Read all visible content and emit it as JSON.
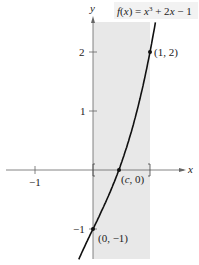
{
  "figure": {
    "function_label": {
      "f": "f",
      "x_open": "(",
      "x": "x",
      "x_close": ")",
      "eq": " = ",
      "xvar": "x",
      "exp": "3",
      "rest": " + 2",
      "xvar2": "x",
      "tail": " − 1"
    },
    "axes": {
      "x_label": "x",
      "y_label": "y",
      "x_ticks": [
        {
          "value": -1,
          "label": "−1"
        },
        {
          "value": 1,
          "label": ""
        }
      ],
      "y_ticks": [
        {
          "value": 2,
          "label": "2"
        },
        {
          "value": 1,
          "label": "1"
        },
        {
          "value": -1,
          "label": "−1"
        }
      ]
    },
    "points": [
      {
        "label": "(1, 2)",
        "x": 1,
        "y": 2
      },
      {
        "label_c": "c",
        "label_prefix": "(",
        "label_suffix": ", 0)",
        "x": 0.4534,
        "y": 0
      },
      {
        "label": "(0, −1)",
        "x": 0,
        "y": -1
      }
    ],
    "interval": {
      "from": 0,
      "to": 1,
      "shade_color": "#e8e8e8"
    },
    "colors": {
      "curve": "#111111",
      "axes": "#555555",
      "shade": "#e8e8e8",
      "text": "#222222"
    }
  }
}
